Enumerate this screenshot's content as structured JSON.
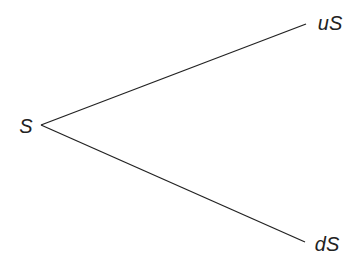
{
  "diagram": {
    "type": "binomial-tree",
    "nodes": {
      "root": {
        "label": "S",
        "x": 26,
        "y": 133
      },
      "up": {
        "label": "uS",
        "x": 330,
        "y": 30
      },
      "down": {
        "label": "dS",
        "x": 327,
        "y": 251
      }
    },
    "edges": [
      {
        "from": "root",
        "to": "up",
        "x1": 41,
        "y1": 125,
        "x2": 306,
        "y2": 24
      },
      {
        "from": "root",
        "to": "down",
        "x1": 41,
        "y1": 125,
        "x2": 305,
        "y2": 242
      }
    ],
    "colors": {
      "line": "#222222",
      "text": "#222222",
      "background": "#ffffff"
    }
  }
}
